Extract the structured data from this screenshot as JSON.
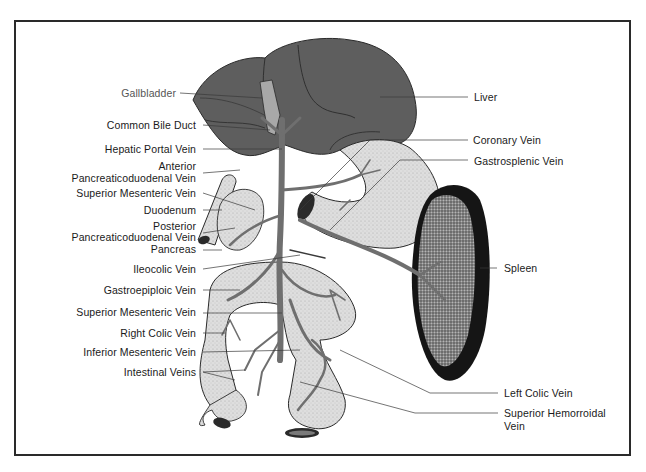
{
  "diagram": {
    "left_labels": [
      {
        "id": "gallbladder",
        "text": "Gallbladder"
      },
      {
        "id": "common-bile-duct",
        "text": "Common Bile Duct"
      },
      {
        "id": "hepatic-portal-vein",
        "text": "Hepatic Portal Vein"
      },
      {
        "id": "anterior-pancreaticoduodenal-vein",
        "line1": "Anterior",
        "line2": "Pancreaticoduodenal Vein"
      },
      {
        "id": "superior-mesenteric-vein-1",
        "text": "Superior Mesenteric Vein"
      },
      {
        "id": "duodenum",
        "text": "Duodenum"
      },
      {
        "id": "posterior-pancreaticoduodenal-vein",
        "line1": "Posterior",
        "line2": "Pancreaticoduodenal Vein"
      },
      {
        "id": "pancreas",
        "text": "Pancreas"
      },
      {
        "id": "ileocolic-vein",
        "text": "Ileocolic Vein"
      },
      {
        "id": "gastroepiploic-vein",
        "text": "Gastroepiploic Vein"
      },
      {
        "id": "superior-mesenteric-vein-2",
        "text": "Superior Mesenteric Vein"
      },
      {
        "id": "right-colic-vein",
        "text": "Right Colic Vein"
      },
      {
        "id": "inferior-mesenteric-vein",
        "text": "Inferior Mesenteric Vein"
      },
      {
        "id": "intestinal-veins",
        "text": "Intestinal Veins"
      }
    ],
    "right_labels": [
      {
        "id": "liver",
        "text": "Liver"
      },
      {
        "id": "coronary-vein",
        "text": "Coronary Vein"
      },
      {
        "id": "gastrosplenic-vein",
        "text": "Gastrosplenic Vein"
      },
      {
        "id": "spleen",
        "text": "Spleen"
      },
      {
        "id": "left-colic-vein",
        "text": "Left Colic Vein"
      },
      {
        "id": "superior-hemorroidal-vein",
        "line1": "Superior Hemorroidal",
        "line2": "Vein"
      }
    ],
    "colors": {
      "liver": "#5e5e5e",
      "vein": "#6f6f6f",
      "organ_fill": "#dcdcdc",
      "spleen_rim": "#151515",
      "spleen_fill": "#7a7a7a",
      "gallbladder": "#a8a8a8",
      "frame": "#2a2a2a"
    }
  }
}
